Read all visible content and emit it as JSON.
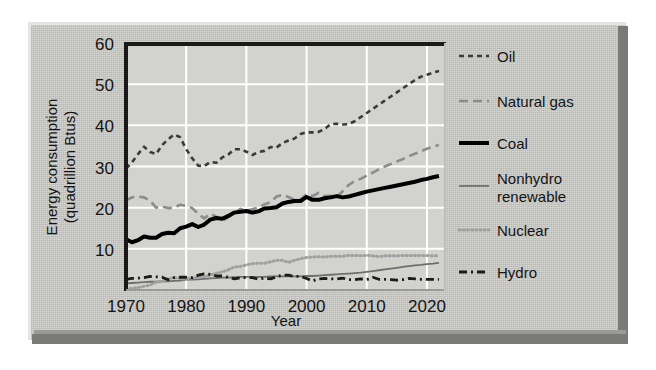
{
  "figure": {
    "background_color": "#ffffff",
    "panel_color": "#c8c8c4",
    "panel_highlight_color": "#e4e4e0",
    "panel_shadow_color": "#7a7a78",
    "plot_background_color": "#d2d2ce",
    "gridline_color": "#ffffff",
    "axis_color": "#1a1a1a"
  },
  "chart_data": {
    "type": "line",
    "title": "",
    "subtitle": "",
    "xlabel": "Year",
    "ylabel": "Energy consumption (quadrillion Btus)",
    "ylabel_line1": "Energy consumption",
    "ylabel_line2": "(quadrillion Btus)",
    "xlim": [
      1970,
      2023
    ],
    "ylim": [
      0,
      60
    ],
    "xticks": [
      1970,
      1980,
      1990,
      2000,
      2010,
      2020
    ],
    "xtick_labels": [
      "1970",
      "1980",
      "1990",
      "2000",
      "2010",
      "2020"
    ],
    "yticks": [
      10,
      20,
      30,
      40,
      50,
      60
    ],
    "ytick_labels": [
      "10",
      "20",
      "30",
      "40",
      "50",
      "60"
    ],
    "grid": true,
    "grid_axis": "both",
    "legend_position": "right",
    "x": [
      1970,
      1971,
      1972,
      1973,
      1974,
      1975,
      1976,
      1977,
      1978,
      1979,
      1980,
      1981,
      1982,
      1983,
      1984,
      1985,
      1986,
      1987,
      1988,
      1989,
      1990,
      1991,
      1992,
      1993,
      1994,
      1995,
      1996,
      1997,
      1998,
      1999,
      2000,
      2001,
      2002,
      2003,
      2004,
      2005,
      2006,
      2007,
      2008,
      2009,
      2010,
      2011,
      2012,
      2013,
      2014,
      2015,
      2016,
      2017,
      2018,
      2019,
      2020,
      2021,
      2022
    ],
    "series": [
      {
        "name": "Oil",
        "color": "#3a3a3a",
        "linestyle": "dashed",
        "linewidth": 2.6,
        "dasharray": "5,4",
        "values": [
          29.5,
          31.0,
          33.0,
          34.8,
          33.5,
          33.0,
          35.2,
          36.6,
          37.8,
          37.1,
          34.2,
          32.0,
          30.2,
          30.1,
          31.1,
          30.9,
          32.2,
          32.9,
          34.2,
          34.2,
          33.6,
          32.8,
          33.5,
          33.8,
          34.7,
          34.6,
          35.7,
          36.3,
          36.8,
          37.9,
          38.3,
          38.3,
          38.4,
          39.1,
          40.3,
          40.4,
          40.2,
          40.3,
          41.0,
          42.0,
          43.0,
          44.0,
          45.0,
          46.0,
          47.0,
          48.0,
          49.0,
          50.0,
          51.0,
          51.8,
          52.3,
          52.8,
          53.2
        ]
      },
      {
        "name": "Natural gas",
        "color": "#8c8c8c",
        "linestyle": "dashed",
        "linewidth": 2.6,
        "dasharray": "9,5",
        "values": [
          21.8,
          22.5,
          22.7,
          22.5,
          21.7,
          20.0,
          20.3,
          19.9,
          20.0,
          20.7,
          20.4,
          19.9,
          18.5,
          17.4,
          18.5,
          17.8,
          16.7,
          17.7,
          18.6,
          19.7,
          19.3,
          19.6,
          20.1,
          20.8,
          21.3,
          22.7,
          23.1,
          22.6,
          21.9,
          22.0,
          23.3,
          22.8,
          23.6,
          22.8,
          22.9,
          22.6,
          24.0,
          25.5,
          26.5,
          27.0,
          27.8,
          28.5,
          29.3,
          30.0,
          30.6,
          31.2,
          31.8,
          32.5,
          33.1,
          33.7,
          34.3,
          34.8,
          35.2
        ]
      },
      {
        "name": "Coal",
        "color": "#000000",
        "linestyle": "solid",
        "linewidth": 4.0,
        "dasharray": "",
        "values": [
          12.3,
          11.6,
          12.1,
          13.0,
          12.7,
          12.7,
          13.6,
          13.9,
          13.8,
          15.0,
          15.4,
          16.0,
          15.3,
          15.9,
          17.1,
          17.5,
          17.3,
          18.0,
          18.8,
          19.0,
          19.2,
          18.8,
          19.1,
          19.8,
          19.9,
          20.1,
          21.0,
          21.4,
          21.6,
          21.6,
          22.6,
          21.9,
          21.9,
          22.3,
          22.5,
          22.8,
          22.5,
          22.7,
          23.1,
          23.5,
          23.9,
          24.2,
          24.5,
          24.8,
          25.1,
          25.4,
          25.7,
          26.0,
          26.3,
          26.7,
          27.0,
          27.4,
          27.7
        ]
      },
      {
        "name": "Nonhydro renewable",
        "color": "#6e6e6e",
        "linestyle": "solid",
        "linewidth": 1.8,
        "dasharray": "",
        "values": [
          1.6,
          1.7,
          1.8,
          1.9,
          2.0,
          2.0,
          2.1,
          2.1,
          2.2,
          2.3,
          2.5,
          2.5,
          2.6,
          2.7,
          2.8,
          2.9,
          3.0,
          3.0,
          3.1,
          3.2,
          3.2,
          3.2,
          3.2,
          3.2,
          3.3,
          3.3,
          3.3,
          3.3,
          3.3,
          3.3,
          3.4,
          3.4,
          3.5,
          3.6,
          3.7,
          3.8,
          3.9,
          4.0,
          4.1,
          4.2,
          4.4,
          4.6,
          4.8,
          5.0,
          5.2,
          5.4,
          5.6,
          5.8,
          6.0,
          6.1,
          6.3,
          6.4,
          6.6
        ]
      },
      {
        "name": "Nuclear",
        "color": "#a0a0a0",
        "linestyle": "dotted",
        "linewidth": 3.0,
        "dasharray": "1.2,3",
        "values": [
          0.2,
          0.4,
          0.6,
          0.9,
          1.2,
          1.9,
          2.1,
          2.7,
          3.0,
          2.8,
          2.7,
          3.0,
          3.1,
          3.2,
          3.6,
          4.1,
          4.4,
          4.9,
          5.6,
          5.7,
          6.1,
          6.4,
          6.5,
          6.5,
          6.8,
          7.2,
          7.2,
          6.7,
          7.2,
          7.6,
          7.9,
          8.0,
          8.1,
          8.0,
          8.2,
          8.2,
          8.2,
          8.4,
          8.4,
          8.3,
          8.4,
          8.3,
          8.1,
          8.3,
          8.3,
          8.3,
          8.4,
          8.4,
          8.4,
          8.4,
          8.4,
          8.3,
          8.3
        ]
      },
      {
        "name": "Hydro",
        "color": "#1a1a1a",
        "linestyle": "dashdot",
        "linewidth": 2.8,
        "dasharray": "8,4,2,4",
        "values": [
          2.6,
          2.8,
          2.9,
          3.0,
          3.3,
          3.2,
          3.1,
          2.5,
          3.0,
          3.1,
          3.1,
          3.0,
          3.6,
          3.9,
          3.8,
          3.4,
          3.4,
          3.1,
          2.7,
          3.0,
          3.0,
          3.0,
          2.6,
          2.9,
          2.7,
          3.2,
          3.6,
          3.6,
          3.3,
          3.3,
          2.8,
          2.2,
          2.7,
          2.8,
          2.7,
          2.7,
          2.9,
          2.5,
          2.5,
          2.7,
          2.5,
          3.1,
          2.6,
          2.6,
          2.5,
          2.4,
          2.5,
          2.8,
          2.7,
          2.6,
          2.6,
          2.6,
          2.6
        ]
      }
    ]
  },
  "legend": {
    "entries": [
      {
        "label": "Oil"
      },
      {
        "label": "Natural gas"
      },
      {
        "label": "Coal"
      },
      {
        "label": "Nonhydro renewable",
        "label_line1": "Nonhydro",
        "label_line2": "renewable"
      },
      {
        "label": "Nuclear"
      },
      {
        "label": "Hydro"
      }
    ]
  }
}
